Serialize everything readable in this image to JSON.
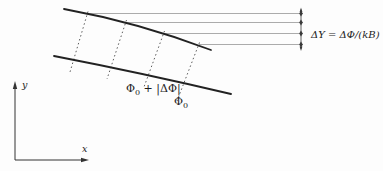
{
  "figure": {
    "equation_label": "ΔY = ΔΦ/(kB)",
    "flux_label_upper": {
      "base": "Φ",
      "sub": "0",
      "rest": " + |ΔΦ|"
    },
    "flux_label_lower": {
      "base": "Φ",
      "sub": "0"
    },
    "axes": {
      "x_label": "x",
      "y_label": "y"
    },
    "colors": {
      "background": "#fdfdfd",
      "curve": "#222222",
      "dashed_line": "#4a4a4a",
      "reference_line": "#8f8f8f",
      "dimension_marker": "#3a3a3a",
      "axis": "#333333",
      "text": "#1c1c1c"
    }
  }
}
